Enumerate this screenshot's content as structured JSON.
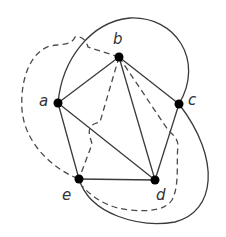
{
  "diagram": {
    "type": "planar graph with dual (dashed) edges",
    "nodes": [
      {
        "id": "a",
        "label": "a",
        "x": 58,
        "y": 103
      },
      {
        "id": "b",
        "label": "b",
        "x": 119,
        "y": 57
      },
      {
        "id": "c",
        "label": "c",
        "x": 179,
        "y": 104
      },
      {
        "id": "d",
        "label": "d",
        "x": 155,
        "y": 180
      },
      {
        "id": "e",
        "label": "e",
        "x": 79,
        "y": 179
      }
    ],
    "solid_edges": [
      [
        "a",
        "b"
      ],
      [
        "a",
        "d"
      ],
      [
        "a",
        "e"
      ],
      [
        "b",
        "c"
      ],
      [
        "b",
        "d"
      ],
      [
        "b",
        "e"
      ],
      [
        "c",
        "d"
      ],
      [
        "e",
        "d"
      ],
      [
        "a",
        "c (outer curve over top)"
      ],
      [
        "e",
        "c (outer curve around bottom right)"
      ]
    ],
    "dashed_edges": [
      [
        "a",
        "b (outer dashed loop)"
      ],
      [
        "b",
        "e (dashed)"
      ],
      [
        "b",
        "d (dashed via c side)"
      ],
      [
        "a",
        "e (dashed outer)"
      ],
      [
        "e",
        "d (dashed lower curve)"
      ]
    ],
    "colors": {
      "edge": "#3a3a3a",
      "node": "#000000",
      "label": "#333333",
      "background": "#ffffff"
    }
  }
}
